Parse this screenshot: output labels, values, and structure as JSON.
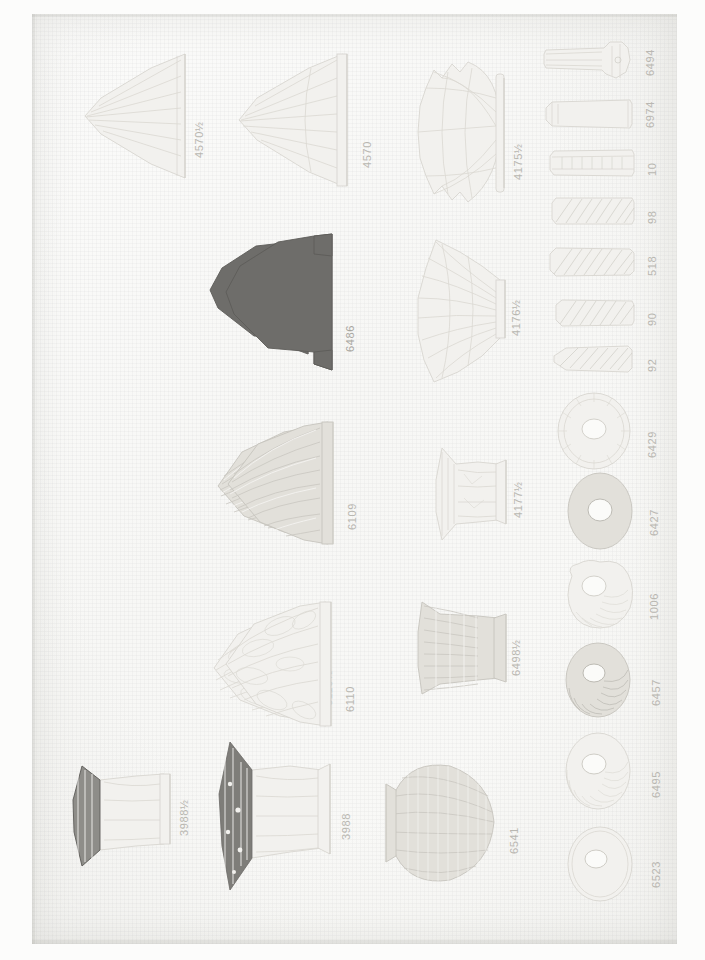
{
  "page": {
    "kind": "scanned-catalog-plate",
    "orientation": "labels-rotated-90-ccw",
    "paper_color": "#faf9f7",
    "ink_color": "#b9b7b1",
    "dark_ink_color": "#6e6d6a"
  },
  "columns": [
    {
      "name": "column-1",
      "items": [
        {
          "label": "4570½",
          "shape": "flared-cone-shade",
          "tone": "pale"
        },
        {
          "label": "6486½",
          "shape": "dome-shade",
          "tone": "dark"
        },
        {
          "label": "6109½",
          "shape": "ribbed-dome-shade",
          "tone": "mid"
        },
        {
          "label": "6110½",
          "shape": "scalloped-dome-shade",
          "tone": "pale"
        },
        {
          "label": "3988½",
          "shape": "ruffled-bell-shade",
          "tone": "mid"
        }
      ]
    },
    {
      "name": "column-2",
      "items": [
        {
          "label": "4570",
          "shape": "flared-cone-shade",
          "tone": "pale"
        },
        {
          "label": "6486",
          "shape": "dome-shade",
          "tone": "dark"
        },
        {
          "label": "6109",
          "shape": "ribbed-dome-shade",
          "tone": "mid"
        },
        {
          "label": "6110",
          "shape": "scalloped-dome-shade",
          "tone": "pale"
        },
        {
          "label": "3988",
          "shape": "ruffled-bell-shade",
          "tone": "mid"
        }
      ]
    },
    {
      "name": "column-3",
      "items": [
        {
          "label": "4175½",
          "shape": "crimped-fan-shade",
          "tone": "pale"
        },
        {
          "label": "4176½",
          "shape": "pleated-fan-shade",
          "tone": "pale"
        },
        {
          "label": "4177½",
          "shape": "small-bell-shade",
          "tone": "pale"
        },
        {
          "label": "6498½",
          "shape": "ribbed-bell-shade",
          "tone": "mid"
        },
        {
          "label": "6541",
          "shape": "woven-globe-shade",
          "tone": "mid"
        }
      ]
    },
    {
      "name": "column-4",
      "items": [
        {
          "label": "6494",
          "shape": "knobbed-stem",
          "tone": "pale"
        },
        {
          "label": "6974",
          "shape": "plain-stem",
          "tone": "pale"
        },
        {
          "label": "10",
          "shape": "banded-stem",
          "tone": "pale"
        },
        {
          "label": "98",
          "shape": "hatched-stem",
          "tone": "pale"
        },
        {
          "label": "518",
          "shape": "hatched-stem",
          "tone": "pale"
        },
        {
          "label": "90",
          "shape": "short-hatched-stem",
          "tone": "pale"
        },
        {
          "label": "92",
          "shape": "tapered-stem",
          "tone": "pale"
        },
        {
          "label": "6429",
          "shape": "fluted-disc",
          "tone": "pale"
        },
        {
          "label": "6427",
          "shape": "plain-disc",
          "tone": "mid"
        },
        {
          "label": "1006",
          "shape": "swirl-rosette",
          "tone": "pale"
        },
        {
          "label": "6457",
          "shape": "swirl-disc",
          "tone": "mid"
        },
        {
          "label": "6495",
          "shape": "swirl-disc",
          "tone": "pale"
        },
        {
          "label": "6523",
          "shape": "plain-disc",
          "tone": "pale"
        }
      ]
    }
  ]
}
